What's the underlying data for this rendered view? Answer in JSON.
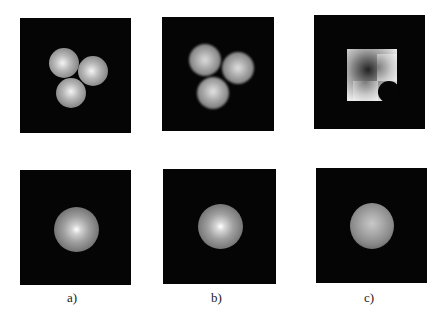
{
  "figure": {
    "top_row": [
      {
        "id": "a",
        "description": "three overlapping smooth gray spheres"
      },
      {
        "id": "b",
        "description": "three overlapping blurred gray spheres"
      },
      {
        "id": "c",
        "description": "cross/clover shaped bright pattern with dark center"
      }
    ],
    "bottom_row": [
      {
        "id": "a",
        "description": "radial glow with bright center"
      },
      {
        "id": "b",
        "description": "radial glow with bright center"
      },
      {
        "id": "c",
        "description": "diffuse radial glow"
      }
    ],
    "labels": [
      "a)",
      "b)",
      "c)"
    ],
    "colors": {
      "panel_bg": "#050505",
      "background": "#ffffff"
    }
  }
}
